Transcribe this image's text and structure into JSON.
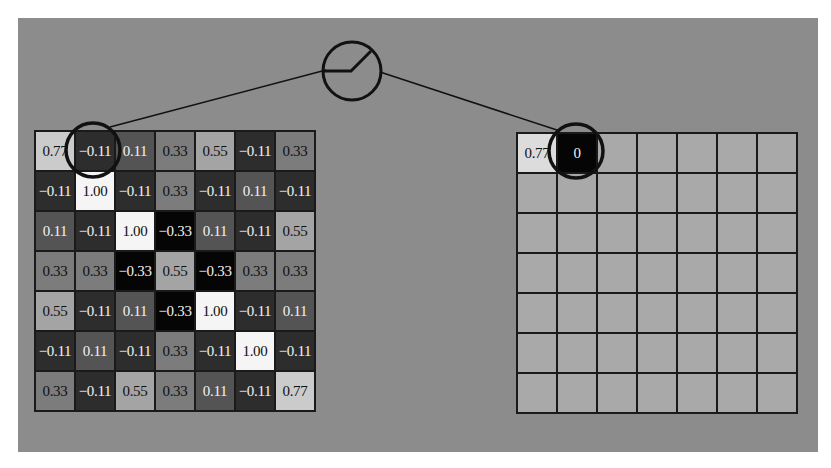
{
  "figure": {
    "background_color": "#8c8c8c"
  },
  "input_map": {
    "rows": [
      [
        "0.77",
        "−0.11",
        "0.11",
        "0.33",
        "0.55",
        "−0.11",
        "0.33"
      ],
      [
        "−0.11",
        "1.00",
        "−0.11",
        "0.33",
        "−0.11",
        "0.11",
        "−0.11"
      ],
      [
        "0.11",
        "−0.11",
        "1.00",
        "−0.33",
        "0.11",
        "−0.11",
        "0.55"
      ],
      [
        "0.33",
        "0.33",
        "−0.33",
        "0.55",
        "−0.33",
        "0.33",
        "0.33"
      ],
      [
        "0.55",
        "−0.11",
        "0.11",
        "−0.33",
        "1.00",
        "−0.11",
        "0.11"
      ],
      [
        "−0.11",
        "0.11",
        "−0.11",
        "0.33",
        "−0.11",
        "1.00",
        "−0.11"
      ],
      [
        "0.33",
        "−0.11",
        "0.55",
        "0.33",
        "0.11",
        "−0.11",
        "0.77"
      ]
    ],
    "highlighted_cell": {
      "row": 0,
      "col": 1
    }
  },
  "output_map": {
    "rows": [
      [
        "0.77",
        "0",
        "",
        "",
        "",
        "",
        ""
      ],
      [
        "",
        "",
        "",
        "",
        "",
        "",
        ""
      ],
      [
        "",
        "",
        "",
        "",
        "",
        "",
        ""
      ],
      [
        "",
        "",
        "",
        "",
        "",
        "",
        ""
      ],
      [
        "",
        "",
        "",
        "",
        "",
        "",
        ""
      ],
      [
        "",
        "",
        "",
        "",
        "",
        "",
        ""
      ],
      [
        "",
        "",
        "",
        "",
        "",
        "",
        ""
      ]
    ],
    "highlighted_cell": {
      "row": 0,
      "col": 1
    }
  },
  "activation_node": {
    "icon": "relu-icon",
    "label": "ReLU"
  }
}
